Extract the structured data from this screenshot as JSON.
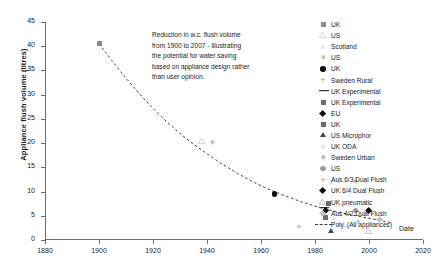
{
  "chart_data": {
    "type": "scatter",
    "title": "",
    "xlabel": "Date",
    "ylabel": "Appliance flush volume (litres)",
    "xlim": [
      1880,
      2020
    ],
    "ylim": [
      0,
      45
    ],
    "xticks": [
      1880,
      1900,
      1920,
      1940,
      1960,
      1980,
      2000,
      2020
    ],
    "yticks": [
      0,
      5,
      10,
      15,
      20,
      25,
      30,
      35,
      40,
      45
    ],
    "grid": false,
    "legend_position": "right",
    "annotation": "Reduction in w.c. flush volume from 1900 to 2007 - illustrating the potential for water saving based on appliance design rather than user opinion.",
    "annotation_lines": [
      "Reduction in w.c. flush volume",
      "from 1900 to 2007 - illustrating",
      "the potential for water saving",
      "based on appliance design rather",
      "than user opinion."
    ],
    "series": [
      {
        "name": "UK",
        "marker": "square",
        "color": "#8c8c8c",
        "points": [
          [
            1900,
            40.5
          ]
        ]
      },
      {
        "name": "US",
        "marker": "triangle-open",
        "color": "#c9c9c9",
        "points": [
          [
            1938,
            20.3
          ]
        ]
      },
      {
        "name": "Scotland",
        "marker": "cross",
        "color": "#d2d2d2",
        "points": [
          [
            1986,
            11.8
          ]
        ]
      },
      {
        "name": "US",
        "marker": "star",
        "color": "#8f8f8f",
        "points": [
          [
            1942,
            20.1
          ]
        ]
      },
      {
        "name": "UK",
        "marker": "circle",
        "color": "#101010",
        "points": [
          [
            1965,
            9.5
          ]
        ]
      },
      {
        "name": "Sweden Rural",
        "marker": "plus",
        "color": "#9a9a9a",
        "points": [
          [
            1974,
            2.6
          ]
        ]
      },
      {
        "name": "UK Experimental",
        "marker": "dash",
        "color": "#3a3a3a",
        "points": [
          [
            1983,
            6.6
          ]
        ]
      },
      {
        "name": "UK Experimental",
        "marker": "square",
        "color": "#6b6b6b",
        "points": [
          [
            1984,
            4.6
          ]
        ]
      },
      {
        "name": "EU",
        "marker": "diamond",
        "color": "#101010",
        "points": [
          [
            1984,
            6.1
          ]
        ]
      },
      {
        "name": "UK",
        "marker": "square",
        "color": "#6b6b6b",
        "points": [
          [
            1985,
            7.6
          ]
        ]
      },
      {
        "name": "US Microphor",
        "marker": "triangle",
        "color": "#4a4a4a",
        "points": [
          [
            1986,
            1.9
          ]
        ]
      },
      {
        "name": "UK ODA",
        "marker": "cross",
        "color": "#d2d2d2",
        "points": [
          [
            1987,
            4.4
          ]
        ]
      },
      {
        "name": "Sweden Urban",
        "marker": "star",
        "color": "#7e7e7e",
        "points": [
          [
            1995,
            11.9
          ]
        ]
      },
      {
        "name": "US",
        "marker": "dot-circle",
        "color": "#9a9a9a",
        "points": [
          [
            1995,
            6.1
          ]
        ]
      },
      {
        "name": "Aus 6/3 Dual Flush",
        "marker": "plus",
        "color": "#9a9a9a",
        "points": [
          [
            1996,
            3.7
          ]
        ]
      },
      {
        "name": "UK 6/4 Dual Flush",
        "marker": "diamond",
        "color": "#101010",
        "points": [
          [
            2000,
            6.0
          ]
        ]
      },
      {
        "name": "UK pneumatic",
        "marker": "triangle-open",
        "color": "#bcbcbc",
        "points": [
          [
            2000,
            1.8
          ]
        ]
      },
      {
        "name": "Aus 4/2 Dual Flush",
        "marker": "diamond",
        "color": "#c2c2c2",
        "points": [
          [
            2004,
            4.3
          ]
        ]
      },
      {
        "name": "Poly. (All appliances)",
        "marker": "line",
        "color": "#3b3b3b",
        "points": []
      }
    ],
    "trend": {
      "name": "Poly. (All appliances)",
      "style": "dashed",
      "color": "#3b3b3b",
      "points": [
        [
          1900,
          40.5
        ],
        [
          1910,
          33.4
        ],
        [
          1920,
          27.2
        ],
        [
          1930,
          22.0
        ],
        [
          1940,
          17.8
        ],
        [
          1950,
          14.2
        ],
        [
          1960,
          11.2
        ],
        [
          1970,
          8.9
        ],
        [
          1980,
          7.0
        ],
        [
          1990,
          5.6
        ],
        [
          2000,
          4.5
        ],
        [
          2008,
          3.6
        ]
      ]
    }
  }
}
